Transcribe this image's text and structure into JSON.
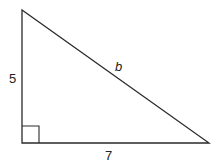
{
  "diagram": {
    "type": "right-triangle",
    "stroke_color": "#2a2a2a",
    "vertices": {
      "top": [
        22,
        10
      ],
      "right_angle": [
        22,
        143
      ],
      "right": [
        209,
        143
      ]
    },
    "labels": {
      "vertical_leg": "5",
      "horizontal_leg": "7",
      "hypotenuse": "b"
    },
    "right_angle_marker": true
  }
}
